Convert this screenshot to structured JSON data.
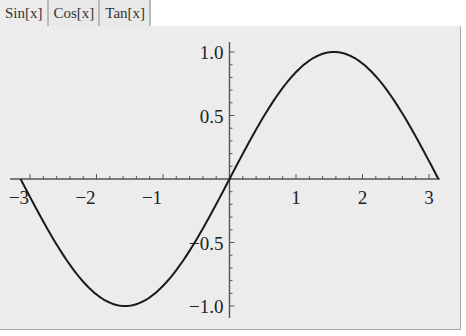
{
  "tabs": [
    {
      "label": "Sin[x]",
      "active": true
    },
    {
      "label": "Cos[x]",
      "active": false
    },
    {
      "label": "Tan[x]",
      "active": false
    }
  ],
  "plot": {
    "function": "Sin[x]",
    "x_tick_labels": [
      "−3",
      "−2",
      "−1",
      "1",
      "2",
      "3"
    ],
    "y_tick_labels": [
      "1.0",
      "0.5",
      "−0.5",
      "−1.0"
    ]
  },
  "colors": {
    "panel_bg": "#ececec",
    "tab_bg": "#e9e9e9",
    "curve": "#1a1a1a",
    "axis": "#555555"
  },
  "chart_data": {
    "type": "line",
    "title": "",
    "xlabel": "",
    "ylabel": "",
    "xlim": [
      -3.14159,
      3.14159
    ],
    "ylim": [
      -1.0,
      1.0
    ],
    "grid": false,
    "series": [
      {
        "name": "Sin[x]",
        "x": [
          -3.14,
          -2.5,
          -2.0,
          -1.5708,
          -1.0,
          -0.5,
          0,
          0.5,
          1.0,
          1.5708,
          2.0,
          2.5,
          3.14
        ],
        "values": [
          0.0,
          -0.598,
          -0.909,
          -1.0,
          -0.841,
          -0.479,
          0.0,
          0.479,
          0.841,
          1.0,
          0.909,
          0.598,
          0.0
        ]
      }
    ],
    "x_ticks": [
      -3,
      -2,
      -1,
      1,
      2,
      3
    ],
    "y_ticks": [
      -1.0,
      -0.5,
      0.5,
      1.0
    ]
  }
}
